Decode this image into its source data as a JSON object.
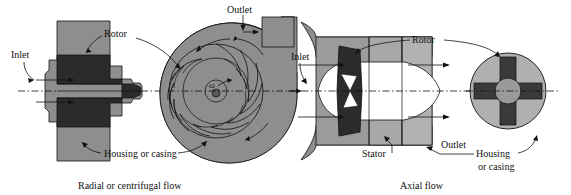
{
  "figure": {
    "panels": [
      {
        "id": "radial",
        "caption": "Radial or centrifugal flow",
        "labels": {
          "inlet": "Inlet",
          "rotor": "Rotor",
          "outlet": "Outlet",
          "housing": "Housing or casing",
          "omega": "ω"
        }
      },
      {
        "id": "axial",
        "caption": "Axial flow",
        "labels": {
          "inlet": "Inlet",
          "rotor": "Rotor",
          "stator": "Stator",
          "outlet": "Outlet",
          "housing_line1": "Housing",
          "housing_line2": "or casing"
        }
      }
    ]
  },
  "colors": {
    "background": "#ffffff",
    "casing_gray": "#8e8e8e",
    "casing_gray_light": "#a8a8a8",
    "rotor_dark": "#2b2b2b",
    "blade_dark": "#3a3a3a",
    "hub_white": "#ffffff",
    "outline": "#111111",
    "text": "#111111"
  },
  "geometry": {
    "canvas_width": 571,
    "canvas_height": 195,
    "radial_impeller_blade_count": 12,
    "axial_rotor_blade_count": 4,
    "radial_centerline_y": 91,
    "axial_centerline_y": 91
  }
}
